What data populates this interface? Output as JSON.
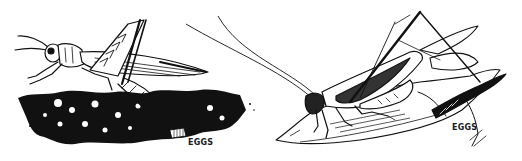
{
  "illustration": {
    "description": "Black-and-white line drawing of two grasshoppers laying eggs",
    "left_panel": {
      "subject": "grasshopper laying eggs in soil",
      "label": "EGGS"
    },
    "right_panel": {
      "subject": "katydid laying eggs in leaf",
      "label": "EGGS"
    },
    "colors": {
      "ink": "#111111",
      "background": "#ffffff"
    }
  }
}
